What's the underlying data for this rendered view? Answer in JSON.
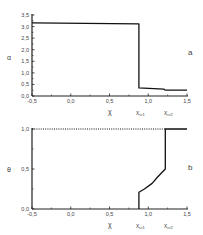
{
  "chart_data": [
    {
      "panel": "a",
      "type": "line",
      "title": "",
      "xlabel": "χ",
      "ylabel": "α",
      "xlim": [
        -0.5,
        1.5
      ],
      "ylim": [
        0.0,
        3.5
      ],
      "xticks": [
        "-0,5",
        "0,0",
        "0,5",
        "1,0",
        "1,5"
      ],
      "yticks": [
        "0,0",
        "0,5",
        "1,0",
        "1,5",
        "2,0",
        "2,5",
        "3,0",
        "3,5"
      ],
      "grid": false,
      "annotations": [
        {
          "text": "χcr1",
          "x": 0.88
        },
        {
          "text": "χcr2",
          "x": 1.22
        }
      ],
      "series": [
        {
          "name": "α(χ)",
          "style": "solid",
          "x": [
            -0.5,
            0.88,
            0.88,
            1.2,
            1.22,
            1.5
          ],
          "y": [
            3.16,
            3.12,
            0.35,
            0.3,
            0.25,
            0.25
          ]
        }
      ]
    },
    {
      "panel": "b",
      "type": "line",
      "title": "",
      "xlabel": "χ",
      "ylabel": "θ",
      "xlim": [
        -0.5,
        1.5
      ],
      "ylim": [
        0.0,
        1.0
      ],
      "xticks": [
        "-0,5",
        "0,0",
        "0,5",
        "1,0",
        "1,5"
      ],
      "yticks": [
        "0,0",
        "0,5",
        "1,0"
      ],
      "grid": false,
      "annotations": [
        {
          "text": "χcr1",
          "x": 0.88
        },
        {
          "text": "χcr2",
          "x": 1.22
        }
      ],
      "series": [
        {
          "name": "θ(χ) dotted",
          "style": "dotted",
          "x": [
            -0.5,
            1.22
          ],
          "y": [
            1.0,
            1.0
          ]
        },
        {
          "name": "θ(χ)",
          "style": "solid",
          "x": [
            0.88,
            0.88,
            0.95,
            1.05,
            1.12,
            1.22,
            1.22,
            1.5
          ],
          "y": [
            0.0,
            0.21,
            0.25,
            0.32,
            0.4,
            0.5,
            1.0,
            1.0
          ]
        }
      ]
    }
  ],
  "labels": {
    "panel_a": "a",
    "panel_b": "b",
    "xlabel": "χ",
    "ylabel_a": "α",
    "ylabel_b": "θ",
    "xcr1_main": "χ",
    "xcr1_sub": "cr1",
    "xcr2_main": "χ",
    "xcr2_sub": "cr2"
  }
}
